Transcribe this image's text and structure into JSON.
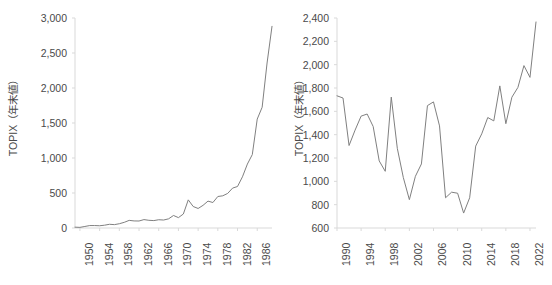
{
  "figure": {
    "background": "#ffffff",
    "line_color": "#808080",
    "axis_color": "#d9d9d9",
    "text_color": "#4a4a4a"
  },
  "chart_data": [
    {
      "type": "line",
      "id": "topix-1949-1989",
      "title": "",
      "xlabel": "",
      "ylabel": "TOPIX（年末値）",
      "xlim": [
        1949,
        1989
      ],
      "ylim": [
        0,
        3000
      ],
      "ytick_labels": [
        "0",
        "500",
        "1,000",
        "1,500",
        "2,000",
        "2,500",
        "3,000"
      ],
      "ytick_values": [
        0,
        500,
        1000,
        1500,
        2000,
        2500,
        3000
      ],
      "xtick_labels": [
        "1950",
        "1954",
        "1958",
        "1962",
        "1966",
        "1970",
        "1974",
        "1978",
        "1982",
        "1986"
      ],
      "xtick_values": [
        1950,
        1954,
        1958,
        1962,
        1966,
        1970,
        1974,
        1978,
        1982,
        1986
      ],
      "grid": false,
      "legend": "none",
      "x": [
        1949,
        1950,
        1951,
        1952,
        1953,
        1954,
        1955,
        1956,
        1957,
        1958,
        1959,
        1960,
        1961,
        1962,
        1963,
        1964,
        1965,
        1966,
        1967,
        1968,
        1969,
        1970,
        1971,
        1972,
        1973,
        1974,
        1975,
        1976,
        1977,
        1978,
        1979,
        1980,
        1981,
        1982,
        1983,
        1984,
        1985,
        1986,
        1987,
        1988,
        1989
      ],
      "y": [
        12,
        9,
        22,
        35,
        35,
        32,
        40,
        53,
        48,
        61,
        81,
        109,
        101,
        100,
        120,
        110,
        106,
        118,
        114,
        131,
        179,
        148,
        200,
        402,
        307,
        279,
        324,
        384,
        364,
        450,
        460,
        494,
        570,
        593,
        731,
        913,
        1049,
        1556,
        1725,
        2357,
        2881
      ]
    },
    {
      "type": "line",
      "id": "topix-1990-2023",
      "title": "",
      "xlabel": "",
      "ylabel": "TOPIX（年末値）",
      "xlim": [
        1990,
        2023
      ],
      "ylim": [
        600,
        2400
      ],
      "ytick_labels": [
        "600",
        "800",
        "1,000",
        "1,200",
        "1,400",
        "1,600",
        "1,800",
        "2,000",
        "2,200",
        "2,400"
      ],
      "ytick_values": [
        600,
        800,
        1000,
        1200,
        1400,
        1600,
        1800,
        2000,
        2200,
        2400
      ],
      "xtick_labels": [
        "1990",
        "1994",
        "1998",
        "2002",
        "2006",
        "2010",
        "2014",
        "2018",
        "2022"
      ],
      "xtick_values": [
        1990,
        1994,
        1998,
        2002,
        2006,
        2010,
        2014,
        2018,
        2022
      ],
      "grid": false,
      "legend": "none",
      "x": [
        1990,
        1991,
        1992,
        1993,
        1994,
        1995,
        1996,
        1997,
        1998,
        1999,
        2000,
        2001,
        2002,
        2003,
        2004,
        2005,
        2006,
        2007,
        2008,
        2009,
        2010,
        2011,
        2012,
        2013,
        2014,
        2015,
        2016,
        2017,
        2018,
        2019,
        2020,
        2021,
        2022,
        2023
      ],
      "y": [
        1733,
        1714,
        1307,
        1439,
        1559,
        1577,
        1470,
        1175,
        1086,
        1722,
        1283,
        1032,
        843,
        1043,
        1149,
        1649,
        1681,
        1475,
        859,
        907,
        898,
        728,
        859,
        1302,
        1407,
        1547,
        1518,
        1818,
        1494,
        1721,
        1805,
        1992,
        1891,
        2366
      ]
    }
  ]
}
